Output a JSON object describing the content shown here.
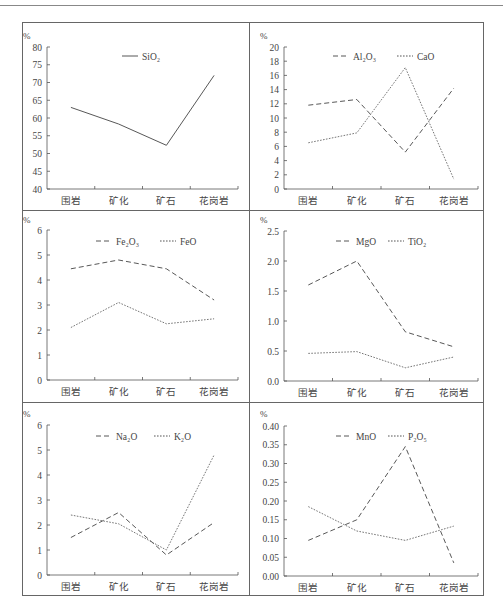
{
  "chart_data": [
    {
      "type": "line",
      "ylabel": "%",
      "categories": [
        "围岩",
        "矿化",
        "矿石",
        "花岗岩"
      ],
      "ylim": [
        40,
        80
      ],
      "yticks": [
        "40",
        "45",
        "50",
        "55",
        "60",
        "65",
        "70",
        "75",
        "80"
      ],
      "series": [
        {
          "name": "SiO₂",
          "style": "solid",
          "values": [
            63.0,
            58.3,
            52.3,
            72.0
          ]
        }
      ]
    },
    {
      "type": "line",
      "ylabel": "%",
      "categories": [
        "围岩",
        "矿化",
        "矿石",
        "花岗岩"
      ],
      "ylim": [
        0,
        20
      ],
      "yticks": [
        "0",
        "2",
        "4",
        "6",
        "8",
        "10",
        "12",
        "14",
        "16",
        "18",
        "20"
      ],
      "series": [
        {
          "name": "Al₂O₃",
          "style": "dashed",
          "values": [
            11.8,
            12.6,
            5.2,
            14.2
          ]
        },
        {
          "name": "CaO",
          "style": "dotted",
          "values": [
            6.5,
            7.9,
            17.1,
            1.4
          ]
        }
      ]
    },
    {
      "type": "line",
      "ylabel": "%",
      "categories": [
        "围岩",
        "矿化",
        "矿石",
        "花岗岩"
      ],
      "ylim": [
        0,
        6
      ],
      "yticks": [
        "0",
        "1",
        "2",
        "3",
        "4",
        "5",
        "6"
      ],
      "series": [
        {
          "name": "Fe₂O₃",
          "style": "dashed",
          "values": [
            4.45,
            4.8,
            4.45,
            3.2
          ]
        },
        {
          "name": "FeO",
          "style": "dotted",
          "values": [
            2.1,
            3.1,
            2.25,
            2.45
          ]
        }
      ]
    },
    {
      "type": "line",
      "ylabel": "%",
      "categories": [
        "围岩",
        "矿化",
        "矿石",
        "花岗岩"
      ],
      "ylim": [
        0,
        2.5
      ],
      "yticks": [
        "0.0",
        "0.5",
        "1.0",
        "1.5",
        "2.0",
        "2.5"
      ],
      "series": [
        {
          "name": "MgO",
          "style": "dashed",
          "values": [
            1.6,
            2.0,
            0.82,
            0.57
          ]
        },
        {
          "name": "TiO₂",
          "style": "dotted",
          "values": [
            0.46,
            0.49,
            0.22,
            0.4
          ]
        }
      ]
    },
    {
      "type": "line",
      "ylabel": "%",
      "categories": [
        "围岩",
        "矿化",
        "矿石",
        "花岗岩"
      ],
      "ylim": [
        0,
        6
      ],
      "yticks": [
        "0",
        "1",
        "2",
        "3",
        "4",
        "5",
        "6"
      ],
      "series": [
        {
          "name": "Na₂O",
          "style": "dashed",
          "values": [
            1.5,
            2.5,
            0.8,
            2.1
          ]
        },
        {
          "name": "K₂O",
          "style": "dotted",
          "values": [
            2.4,
            2.05,
            1.0,
            4.8
          ]
        }
      ]
    },
    {
      "type": "line",
      "ylabel": "%",
      "categories": [
        "围岩",
        "矿化",
        "矿石",
        "花岗岩"
      ],
      "ylim": [
        0,
        0.4
      ],
      "yticks": [
        "0.00",
        "0.05",
        "0.10",
        "0.15",
        "0.20",
        "0.25",
        "0.30",
        "0.35",
        "0.40"
      ],
      "series": [
        {
          "name": "MnO",
          "style": "dashed",
          "values": [
            0.095,
            0.15,
            0.345,
            0.035
          ]
        },
        {
          "name": "P₂O₅",
          "style": "dotted",
          "values": [
            0.185,
            0.12,
            0.095,
            0.133
          ]
        }
      ]
    }
  ]
}
